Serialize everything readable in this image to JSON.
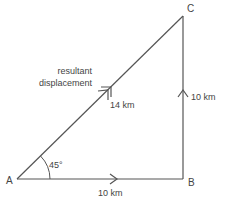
{
  "diagram": {
    "type": "vector-triangle",
    "colors": {
      "line": "#555555",
      "text": "#444444",
      "background": "#ffffff"
    },
    "points": {
      "A": {
        "label": "A"
      },
      "B": {
        "label": "B"
      },
      "C": {
        "label": "C"
      }
    },
    "vectors": [
      {
        "from": "A",
        "to": "B",
        "label": "10 km",
        "arrow": "single"
      },
      {
        "from": "B",
        "to": "C",
        "label": "10 km",
        "arrow": "single"
      },
      {
        "from": "A",
        "to": "C",
        "label": "14 km",
        "arrow": "double"
      }
    ],
    "angle": {
      "at": "A",
      "label": "45°"
    },
    "annotation": {
      "line1": "resultant",
      "line2": "displacement"
    }
  }
}
